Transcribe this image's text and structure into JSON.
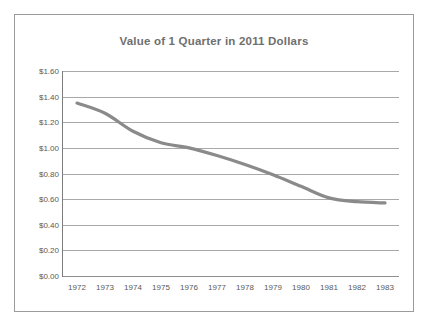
{
  "chart_data": {
    "type": "line",
    "title": "Value of 1 Quarter in 2011 Dollars",
    "xlabel": "",
    "ylabel": "",
    "categories": [
      "1972",
      "1973",
      "1974",
      "1975",
      "1976",
      "1977",
      "1978",
      "1979",
      "1980",
      "1981",
      "1982",
      "1983"
    ],
    "x": [
      1972,
      1973,
      1974,
      1975,
      1976,
      1977,
      1978,
      1979,
      1980,
      1981,
      1982,
      1983
    ],
    "values": [
      1.35,
      1.27,
      1.13,
      1.04,
      1.0,
      0.94,
      0.87,
      0.79,
      0.7,
      0.61,
      0.58,
      0.57
    ],
    "series": [
      {
        "name": "Value of 1 Quarter in 2011 Dollars",
        "values": [
          1.35,
          1.27,
          1.13,
          1.04,
          1.0,
          0.94,
          0.87,
          0.79,
          0.7,
          0.61,
          0.58,
          0.57
        ]
      }
    ],
    "ylim": [
      0.0,
      1.6
    ],
    "yticks": [
      0.0,
      0.2,
      0.4,
      0.6,
      0.8,
      1.0,
      1.2,
      1.4,
      1.6
    ],
    "ytick_labels": [
      "$0.00",
      "$0.20",
      "$0.40",
      "$0.60",
      "$0.80",
      "$1.00",
      "$1.20",
      "$1.40",
      "$1.60"
    ],
    "grid": true,
    "legend": false,
    "legend_position": "none",
    "line_color": "#8a8a8a",
    "grid_color": "#a8a8a8",
    "title_color": "#6f6f6f",
    "tick_label_color": "#595959",
    "border_color": "#9b9b9b",
    "background_color": "#ffffff"
  }
}
